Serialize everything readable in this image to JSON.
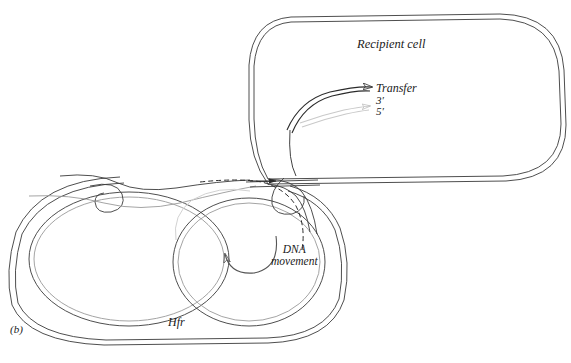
{
  "figure": {
    "panel_label": "(b)",
    "caption_topic": "bacterial-conjugation-rolling-circle-transfer"
  },
  "labels": {
    "recipient_cell": "Recipient cell",
    "transfer": "Transfer",
    "three_prime": "3′",
    "five_prime": "5′",
    "dna_movement_line1": "DNA",
    "dna_movement_line2": "movement",
    "hfr": "Hfr"
  },
  "icons": {
    "transfer_arrow": "transfer-arrow-icon",
    "five_prime_arrow": "five-prime-strand-arrow-icon",
    "dna_rotation_arrow": "dna-rotation-arrow-icon",
    "conjugation_bridge": "conjugation-bridge-icon"
  },
  "colors": {
    "background": "#ffffff",
    "cell_wall_stroke": "#3a3a3a",
    "dna_dark_strand": "#2b2b2b",
    "dna_light_strand": "#c9c9c9",
    "label_text": "#1a1a1a"
  },
  "geometry": {
    "width": 571,
    "height": 363,
    "recipient_cell_bounds": [
      248,
      14,
      566,
      184
    ],
    "hfr_cell_bounds": [
      6,
      176,
      348,
      348
    ]
  }
}
